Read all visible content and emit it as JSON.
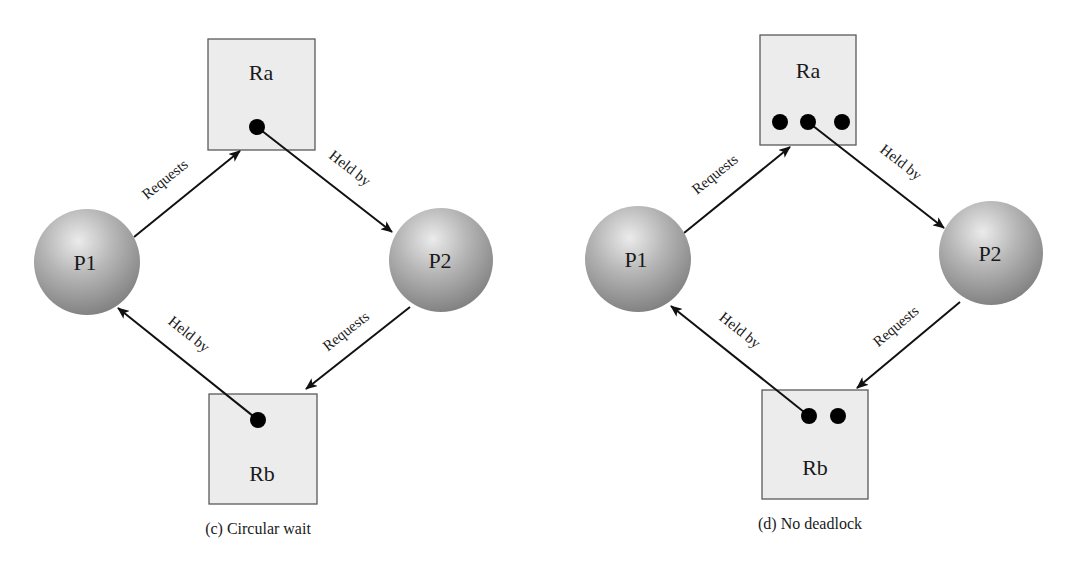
{
  "diagrams": [
    {
      "id": "c",
      "caption": "(c) Circular wait",
      "processes": [
        {
          "label": "P1",
          "cx": 87,
          "cy": 262,
          "r": 53
        },
        {
          "label": "P2",
          "cx": 441,
          "cy": 260,
          "r": 52
        }
      ],
      "resources": [
        {
          "label": "Ra",
          "x": 208,
          "y": 39,
          "w": 107,
          "h": 111,
          "label_y": 80,
          "instances": [
            {
              "cx": 257,
              "cy": 127
            }
          ]
        },
        {
          "label": "Rb",
          "x": 209,
          "y": 394,
          "w": 108,
          "h": 110,
          "label_y": 481,
          "instances": [
            {
              "cx": 258,
              "cy": 420
            }
          ]
        }
      ],
      "edges": [
        {
          "label": "Requests",
          "from": "P1",
          "to": "Ra",
          "x1": 134,
          "y1": 237,
          "x2": 240,
          "y2": 151,
          "lx": 168,
          "ly": 183
        },
        {
          "label": "Held by",
          "from": "Ra",
          "to": "P2",
          "x1": 257,
          "y1": 127,
          "x2": 392,
          "y2": 232,
          "lx": 347,
          "ly": 172
        },
        {
          "label": "Held by",
          "from": "Rb",
          "to": "P1",
          "x1": 258,
          "y1": 420,
          "x2": 118,
          "y2": 308,
          "lx": 186,
          "ly": 338
        },
        {
          "label": "Requests",
          "from": "P2",
          "to": "Rb",
          "x1": 410,
          "y1": 307,
          "x2": 306,
          "y2": 389,
          "lx": 349,
          "ly": 335
        }
      ],
      "caption_x": 258,
      "caption_y": 534
    },
    {
      "id": "d",
      "caption": "(d) No deadlock",
      "processes": [
        {
          "label": "P1",
          "cx": 638,
          "cy": 259,
          "r": 53
        },
        {
          "label": "P2",
          "cx": 991,
          "cy": 253,
          "r": 52
        }
      ],
      "resources": [
        {
          "label": "Ra",
          "x": 760,
          "y": 35,
          "w": 96,
          "h": 110,
          "label_y": 78,
          "instances": [
            {
              "cx": 780,
              "cy": 122
            },
            {
              "cx": 808,
              "cy": 122
            },
            {
              "cx": 842,
              "cy": 122
            }
          ]
        },
        {
          "label": "Rb",
          "x": 762,
          "y": 390,
          "w": 106,
          "h": 109,
          "label_y": 475,
          "instances": [
            {
              "cx": 809,
              "cy": 416
            },
            {
              "cx": 838,
              "cy": 416
            }
          ]
        }
      ],
      "edges": [
        {
          "label": "Requests",
          "from": "P1",
          "to": "Ra",
          "x1": 684,
          "y1": 233,
          "x2": 790,
          "y2": 147,
          "lx": 718,
          "ly": 178
        },
        {
          "label": "Held by",
          "from": "Ra",
          "to": "P2",
          "x1": 808,
          "y1": 122,
          "x2": 944,
          "y2": 228,
          "lx": 898,
          "ly": 166
        },
        {
          "label": "Held by",
          "from": "Rb",
          "to": "P1",
          "x1": 809,
          "y1": 416,
          "x2": 671,
          "y2": 306,
          "lx": 737,
          "ly": 334
        },
        {
          "label": "Requests",
          "from": "P2",
          "to": "Rb",
          "x1": 960,
          "y1": 302,
          "x2": 857,
          "y2": 388,
          "lx": 899,
          "ly": 330
        }
      ],
      "caption_x": 810,
      "caption_y": 529
    }
  ],
  "style": {
    "box_fill": "#ececec",
    "box_stroke": "#5a5a5a",
    "sphere_light": "#e4e4e4",
    "sphere_mid": "#a8a8a8",
    "sphere_dark": "#7a7a7a",
    "edge_color": "#111111",
    "dot_color": "#000000"
  }
}
